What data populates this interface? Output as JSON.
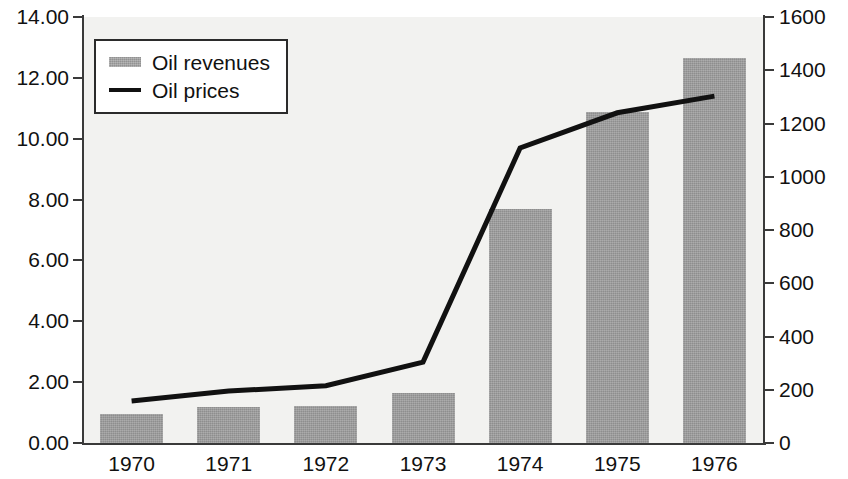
{
  "chart_data": {
    "type": "bar",
    "title": "",
    "subtitle": "",
    "xlabel": "",
    "ylabel": "",
    "categories": [
      "1970",
      "1971",
      "1972",
      "1973",
      "1974",
      "1975",
      "1976"
    ],
    "grid": false,
    "legend_position": "top-left",
    "series": [
      {
        "name": "Oil revenues",
        "type": "bar",
        "axis": "left",
        "color": "#9a9a9a",
        "values": [
          0.95,
          1.18,
          1.22,
          1.66,
          7.68,
          10.87,
          12.65
        ]
      },
      {
        "name": "Oil prices",
        "type": "line",
        "axis": "right",
        "color": "#111111",
        "values": [
          158,
          195,
          215,
          304,
          1108,
          1240,
          1303
        ]
      }
    ],
    "left_axis": {
      "min": 0,
      "max": 14,
      "step": 2,
      "tick_labels": [
        "0.00",
        "2.00",
        "4.00",
        "6.00",
        "8.00",
        "10.00",
        "12.00",
        "14.00"
      ]
    },
    "right_axis": {
      "min": 0,
      "max": 1600,
      "step": 200,
      "tick_labels": [
        "0",
        "200",
        "400",
        "600",
        "800",
        "1000",
        "1200",
        "1400",
        "1600"
      ]
    }
  },
  "legend": {
    "items": [
      {
        "label": "Oil revenues",
        "marker": "bar-swatch-icon"
      },
      {
        "label": "Oil prices",
        "marker": "line-swatch-icon"
      }
    ]
  }
}
